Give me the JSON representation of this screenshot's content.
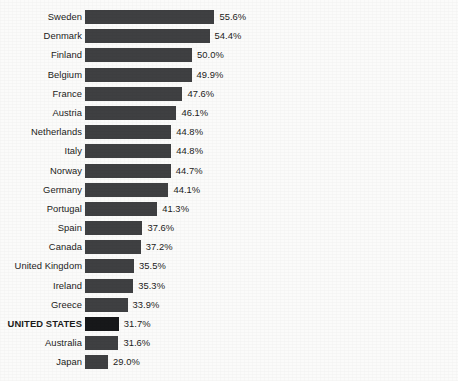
{
  "chart_data": {
    "type": "bar",
    "orientation": "horizontal",
    "title": "",
    "subtitle": "",
    "xlabel": "",
    "ylabel": "",
    "grid": false,
    "legend": null,
    "axis_truncated": true,
    "xlim": [
      23.25,
      66.5
    ],
    "value_suffix": "%",
    "highlight_category": "UNITED STATES",
    "categories": [
      "Sweden",
      "Denmark",
      "Finland",
      "Belgium",
      "France",
      "Austria",
      "Netherlands",
      "Italy",
      "Norway",
      "Germany",
      "Portugal",
      "Spain",
      "Canada",
      "United Kingdom",
      "Ireland",
      "Greece",
      "UNITED STATES",
      "Australia",
      "Japan"
    ],
    "values": [
      55.6,
      54.4,
      50.0,
      49.9,
      47.6,
      46.1,
      44.8,
      44.8,
      44.7,
      44.1,
      41.3,
      37.6,
      37.2,
      35.5,
      35.3,
      33.9,
      31.7,
      31.6,
      29.0
    ],
    "value_labels": [
      "55.6%",
      "54.4%",
      "50.0%",
      "49.9%",
      "47.6%",
      "46.1%",
      "44.8%",
      "44.8%",
      "44.7%",
      "44.1%",
      "41.3%",
      "37.6%",
      "37.2%",
      "35.5%",
      "35.3%",
      "33.9%",
      "31.7%",
      "31.6%",
      "29.0%"
    ],
    "colors": {
      "bar": "#3f4042",
      "bar_highlight": "#17181a",
      "background": "#fbfbfa",
      "text": "#1b1b1b"
    }
  }
}
